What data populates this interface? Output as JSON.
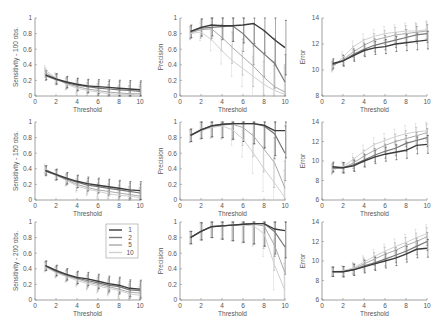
{
  "figure": {
    "rows": [
      "100 obs.",
      "150 obs.",
      "200 obs."
    ],
    "columns": [
      "Sensitivity",
      "Precision",
      "Error"
    ]
  },
  "legend": {
    "entries": [
      {
        "label": "1",
        "color": "#3a3a3a"
      },
      {
        "label": "2",
        "color": "#777777"
      },
      {
        "label": "5",
        "color": "#aaaaaa"
      },
      {
        "label": "10",
        "color": "#d0d0d0"
      }
    ],
    "panel": "row3-col1"
  },
  "chart_data": [
    {
      "type": "line",
      "id": "sens-100",
      "title": "",
      "xlabel": "Threshold",
      "ylabel": "Sensitivity - 100 obs.",
      "xlim": [
        0,
        10
      ],
      "ylim": [
        0,
        1
      ],
      "xticks": [
        0,
        2,
        4,
        6,
        8,
        10
      ],
      "yticks": [
        0,
        0.2,
        0.4,
        0.6,
        0.8,
        1
      ],
      "x": [
        1,
        2,
        3,
        4,
        5,
        6,
        7,
        8,
        9,
        10
      ],
      "series": [
        {
          "name": "1",
          "values": [
            0.27,
            0.22,
            0.18,
            0.15,
            0.13,
            0.12,
            0.11,
            0.1,
            0.09,
            0.08
          ]
        },
        {
          "name": "2",
          "values": [
            0.26,
            0.21,
            0.17,
            0.14,
            0.12,
            0.1,
            0.09,
            0.08,
            0.07,
            0.06
          ]
        },
        {
          "name": "5",
          "values": [
            0.3,
            0.22,
            0.16,
            0.12,
            0.09,
            0.07,
            0.05,
            0.04,
            0.03,
            0.03
          ]
        },
        {
          "name": "10",
          "values": [
            0.33,
            0.23,
            0.15,
            0.1,
            0.07,
            0.05,
            0.03,
            0.02,
            0.02,
            0.01
          ]
        }
      ]
    },
    {
      "type": "line",
      "id": "prec-100",
      "title": "",
      "xlabel": "Threshold",
      "ylabel": "Precision",
      "xlim": [
        0,
        10
      ],
      "ylim": [
        0,
        1
      ],
      "xticks": [
        0,
        2,
        4,
        6,
        8,
        10
      ],
      "yticks": [
        0,
        0.2,
        0.4,
        0.6,
        0.8,
        1
      ],
      "x": [
        1,
        2,
        3,
        4,
        5,
        6,
        7,
        8,
        9,
        10
      ],
      "series": [
        {
          "name": "1",
          "values": [
            0.83,
            0.88,
            0.91,
            0.9,
            0.9,
            0.91,
            0.93,
            0.84,
            0.72,
            0.62
          ]
        },
        {
          "name": "2",
          "values": [
            0.82,
            0.87,
            0.88,
            0.89,
            0.9,
            0.8,
            0.66,
            0.54,
            0.42,
            0.18
          ]
        },
        {
          "name": "5",
          "values": [
            0.81,
            0.85,
            0.86,
            0.75,
            0.62,
            0.5,
            0.38,
            0.24,
            0.12,
            0.05
          ]
        },
        {
          "name": "10",
          "values": [
            0.8,
            0.82,
            0.72,
            0.58,
            0.45,
            0.35,
            0.25,
            0.15,
            0.07,
            0.02
          ]
        }
      ]
    },
    {
      "type": "line",
      "id": "err-100",
      "title": "",
      "xlabel": "Threshold",
      "ylabel": "Error",
      "xlim": [
        0,
        10
      ],
      "ylim": [
        8,
        14
      ],
      "xticks": [
        0,
        2,
        4,
        6,
        8,
        10
      ],
      "yticks": [
        8,
        10,
        12,
        14
      ],
      "x": [
        1,
        2,
        3,
        4,
        5,
        6,
        7,
        8,
        9,
        10
      ],
      "series": [
        {
          "name": "1",
          "values": [
            10.5,
            10.7,
            11.1,
            11.5,
            11.7,
            11.8,
            12.0,
            12.1,
            12.2,
            12.3
          ]
        },
        {
          "name": "2",
          "values": [
            10.4,
            10.7,
            11.2,
            11.6,
            11.9,
            12.1,
            12.3,
            12.5,
            12.7,
            12.8
          ]
        },
        {
          "name": "5",
          "values": [
            10.3,
            10.8,
            11.4,
            11.9,
            12.3,
            12.5,
            12.7,
            12.8,
            12.9,
            13.0
          ]
        },
        {
          "name": "10",
          "values": [
            10.2,
            11.0,
            11.8,
            12.3,
            12.6,
            12.8,
            12.9,
            13.0,
            13.0,
            13.1
          ]
        }
      ]
    },
    {
      "type": "line",
      "id": "sens-150",
      "title": "",
      "xlabel": "Threshold",
      "ylabel": "Sensitivity - 150 obs.",
      "xlim": [
        0,
        10
      ],
      "ylim": [
        0,
        1
      ],
      "xticks": [
        0,
        2,
        4,
        6,
        8,
        10
      ],
      "yticks": [
        0,
        0.2,
        0.4,
        0.6,
        0.8,
        1
      ],
      "x": [
        1,
        2,
        3,
        4,
        5,
        6,
        7,
        8,
        9,
        10
      ],
      "series": [
        {
          "name": "1",
          "values": [
            0.38,
            0.33,
            0.28,
            0.24,
            0.21,
            0.19,
            0.17,
            0.15,
            0.13,
            0.12
          ]
        },
        {
          "name": "2",
          "values": [
            0.37,
            0.32,
            0.27,
            0.23,
            0.19,
            0.17,
            0.15,
            0.13,
            0.11,
            0.09
          ]
        },
        {
          "name": "5",
          "values": [
            0.38,
            0.32,
            0.26,
            0.2,
            0.16,
            0.13,
            0.11,
            0.09,
            0.07,
            0.05
          ]
        },
        {
          "name": "10",
          "values": [
            0.4,
            0.32,
            0.25,
            0.18,
            0.14,
            0.11,
            0.08,
            0.06,
            0.05,
            0.03
          ]
        }
      ]
    },
    {
      "type": "line",
      "id": "prec-150",
      "title": "",
      "xlabel": "Threshold",
      "ylabel": "Precision",
      "xlim": [
        0,
        10
      ],
      "ylim": [
        0,
        1
      ],
      "xticks": [
        0,
        2,
        4,
        6,
        8,
        10
      ],
      "yticks": [
        0,
        0.2,
        0.4,
        0.6,
        0.8,
        1
      ],
      "x": [
        1,
        2,
        3,
        4,
        5,
        6,
        7,
        8,
        9,
        10
      ],
      "series": [
        {
          "name": "1",
          "values": [
            0.83,
            0.9,
            0.95,
            0.97,
            0.98,
            0.98,
            0.98,
            0.96,
            0.89,
            0.89
          ]
        },
        {
          "name": "2",
          "values": [
            0.83,
            0.9,
            0.95,
            0.97,
            0.98,
            0.98,
            0.98,
            0.95,
            0.85,
            0.6
          ]
        },
        {
          "name": "5",
          "values": [
            0.82,
            0.89,
            0.94,
            0.96,
            0.97,
            0.93,
            0.82,
            0.65,
            0.48,
            0.15
          ]
        },
        {
          "name": "10",
          "values": [
            0.82,
            0.89,
            0.93,
            0.95,
            0.9,
            0.78,
            0.6,
            0.4,
            0.22,
            0.03
          ]
        }
      ]
    },
    {
      "type": "line",
      "id": "err-150",
      "title": "",
      "xlabel": "Threshold",
      "ylabel": "Error",
      "xlim": [
        0,
        10
      ],
      "ylim": [
        6,
        14
      ],
      "xticks": [
        0,
        2,
        4,
        6,
        8,
        10
      ],
      "yticks": [
        6,
        8,
        10,
        12,
        14
      ],
      "x": [
        1,
        2,
        3,
        4,
        5,
        6,
        7,
        8,
        9,
        10
      ],
      "series": [
        {
          "name": "1",
          "values": [
            9.4,
            9.3,
            9.5,
            10.0,
            10.4,
            10.7,
            10.9,
            11.1,
            11.6,
            11.7
          ]
        },
        {
          "name": "2",
          "values": [
            9.3,
            9.3,
            9.6,
            10.1,
            10.6,
            11.0,
            11.3,
            11.8,
            12.1,
            12.4
          ]
        },
        {
          "name": "5",
          "values": [
            9.2,
            9.3,
            9.8,
            10.5,
            11.1,
            11.6,
            12.0,
            12.3,
            12.6,
            12.9
          ]
        },
        {
          "name": "10",
          "values": [
            9.1,
            9.4,
            10.2,
            11.0,
            11.7,
            12.1,
            12.5,
            12.8,
            13.0,
            13.1
          ]
        }
      ]
    },
    {
      "type": "line",
      "id": "sens-200",
      "title": "",
      "xlabel": "Threshold",
      "ylabel": "Sensitivity - 200 obs.",
      "xlim": [
        0,
        10
      ],
      "ylim": [
        0,
        1
      ],
      "xticks": [
        0,
        2,
        4,
        6,
        8,
        10
      ],
      "yticks": [
        0,
        0.2,
        0.4,
        0.6,
        0.8,
        1
      ],
      "x": [
        1,
        2,
        3,
        4,
        5,
        6,
        7,
        8,
        9,
        10
      ],
      "series": [
        {
          "name": "1",
          "values": [
            0.44,
            0.38,
            0.33,
            0.29,
            0.27,
            0.24,
            0.21,
            0.19,
            0.15,
            0.14
          ]
        },
        {
          "name": "2",
          "values": [
            0.44,
            0.37,
            0.32,
            0.28,
            0.25,
            0.22,
            0.19,
            0.17,
            0.13,
            0.12
          ]
        },
        {
          "name": "5",
          "values": [
            0.43,
            0.36,
            0.31,
            0.27,
            0.23,
            0.2,
            0.17,
            0.14,
            0.1,
            0.09
          ]
        },
        {
          "name": "10",
          "values": [
            0.42,
            0.35,
            0.3,
            0.25,
            0.21,
            0.18,
            0.15,
            0.12,
            0.08,
            0.06
          ]
        }
      ]
    },
    {
      "type": "line",
      "id": "prec-200",
      "title": "",
      "xlabel": "Threshold",
      "ylabel": "Precision",
      "xlim": [
        0,
        10
      ],
      "ylim": [
        0,
        1
      ],
      "xticks": [
        0,
        2,
        4,
        6,
        8,
        10
      ],
      "yticks": [
        0,
        0.2,
        0.4,
        0.6,
        0.8,
        1
      ],
      "x": [
        1,
        2,
        3,
        4,
        5,
        6,
        7,
        8,
        9,
        10
      ],
      "series": [
        {
          "name": "1",
          "values": [
            0.8,
            0.88,
            0.94,
            0.95,
            0.96,
            0.97,
            0.98,
            0.98,
            0.91,
            0.89
          ]
        },
        {
          "name": "2",
          "values": [
            0.8,
            0.88,
            0.94,
            0.95,
            0.96,
            0.97,
            0.98,
            0.98,
            0.88,
            0.68
          ]
        },
        {
          "name": "5",
          "values": [
            0.8,
            0.88,
            0.94,
            0.95,
            0.96,
            0.97,
            0.97,
            0.95,
            0.7,
            0.35
          ]
        },
        {
          "name": "10",
          "values": [
            0.8,
            0.88,
            0.94,
            0.95,
            0.96,
            0.96,
            0.95,
            0.85,
            0.45,
            0.12
          ]
        }
      ]
    },
    {
      "type": "line",
      "id": "err-200",
      "title": "",
      "xlabel": "Threshold",
      "ylabel": "Error",
      "xlim": [
        0,
        10
      ],
      "ylim": [
        6,
        14
      ],
      "xticks": [
        0,
        2,
        4,
        6,
        8,
        10
      ],
      "yticks": [
        6,
        8,
        10,
        12,
        14
      ],
      "x": [
        1,
        2,
        3,
        4,
        5,
        6,
        7,
        8,
        9,
        10
      ],
      "series": [
        {
          "name": "1",
          "values": [
            8.9,
            8.9,
            9.1,
            9.4,
            9.7,
            10.0,
            10.3,
            10.7,
            11.2,
            11.3
          ]
        },
        {
          "name": "2",
          "values": [
            8.9,
            8.9,
            9.1,
            9.5,
            9.8,
            10.2,
            10.6,
            11.0,
            11.5,
            12.0
          ]
        },
        {
          "name": "5",
          "values": [
            8.9,
            8.9,
            9.2,
            9.7,
            10.2,
            10.7,
            11.1,
            11.6,
            12.0,
            12.5
          ]
        },
        {
          "name": "10",
          "values": [
            8.9,
            9.0,
            9.3,
            9.9,
            10.5,
            11.0,
            11.5,
            11.9,
            12.4,
            12.8
          ]
        }
      ]
    }
  ]
}
